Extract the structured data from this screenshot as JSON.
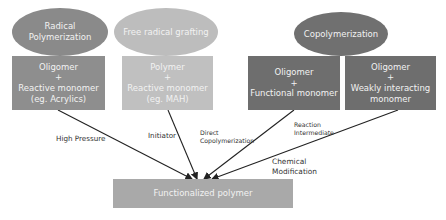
{
  "diagram": {
    "ellipses": [
      {
        "id": "radical-polymerization",
        "lines": [
          "Radical",
          "Polymerization"
        ],
        "color": "#8a8a8a"
      },
      {
        "id": "free-radical-grafting",
        "lines": [
          "Free radical grafting"
        ],
        "color": "#bdbdbd"
      },
      {
        "id": "copolymerization",
        "lines": [
          "Copolymerization"
        ],
        "color": "#707070"
      }
    ],
    "boxes": [
      {
        "id": "oligomer-reactive-monomer",
        "lines": [
          "Oligomer",
          "+",
          "Reactive monomer",
          "(eg. Acrylics)"
        ],
        "color": "#8e8e8e"
      },
      {
        "id": "polymer-reactive-monomer",
        "lines": [
          "Polymer",
          "+",
          "Reactive monomer",
          "(eg. MAH)"
        ],
        "color": "#c0c0c0"
      },
      {
        "id": "oligomer-functional-monomer",
        "lines": [
          "Oligomer",
          "+",
          "Functional monomer"
        ],
        "color": "#6e6e6e"
      },
      {
        "id": "oligomer-weakly-interacting-monomer",
        "lines": [
          "Oligomer",
          "+",
          "Weakly interacting",
          "monomer"
        ],
        "color": "#6e6e6e"
      }
    ],
    "target": {
      "id": "functionalized-polymer",
      "label": "Functionalized polymer",
      "color": "#a9a9a9"
    },
    "edge_labels": [
      {
        "id": "high-pressure",
        "lines": [
          "High Pressure"
        ]
      },
      {
        "id": "initiator",
        "lines": [
          "Initiator"
        ]
      },
      {
        "id": "direct-copolymerization",
        "lines": [
          "Direct",
          "Copolymerization"
        ]
      },
      {
        "id": "reaction-intermediate",
        "lines": [
          "Reaction",
          "Intermediate"
        ]
      },
      {
        "id": "chemical-modification",
        "lines": [
          "Chemical",
          "Modification"
        ]
      }
    ],
    "arrow_color": "#222222"
  }
}
